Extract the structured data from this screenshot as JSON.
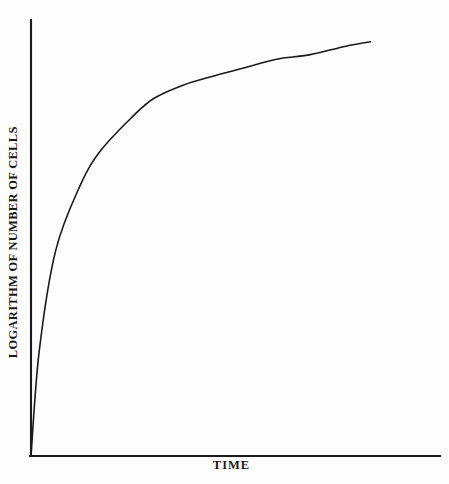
{
  "chart_data": {
    "type": "line",
    "title": "",
    "subtitle": "",
    "xlabel": "TIME",
    "ylabel": "LOGARITHM OF NUMBER OF CELLS",
    "x_tick_labels": [],
    "y_tick_labels": [],
    "grid": false,
    "legend": null,
    "legend_position": "none",
    "xlim": [
      0,
      1
    ],
    "ylim": [
      0,
      1
    ],
    "annotations": [],
    "series": [
      {
        "name": "growth curve",
        "description": "Bacterial growth: steep exponential rise followed by gradual flattening toward a stationary phase",
        "line_color": "#1a1a1a",
        "line_width": 1.6,
        "x": [
          0.0,
          0.02,
          0.06,
          0.12,
          0.17,
          0.25,
          0.3,
          0.37,
          0.44,
          0.52,
          0.6,
          0.68,
          0.77,
          0.83
        ],
        "y": [
          0.0,
          0.24,
          0.47,
          0.62,
          0.7,
          0.78,
          0.82,
          0.85,
          0.87,
          0.89,
          0.91,
          0.92,
          0.94,
          0.95
        ]
      }
    ]
  },
  "axes": {
    "y_axis_line": {
      "x": 31,
      "y_top": 20,
      "y_bottom": 456
    },
    "x_axis_line": {
      "y": 456,
      "x_left": 31,
      "x_right": 440
    },
    "axis_color": "#1a1a1a"
  },
  "colors": {
    "background": "#fdfdfd",
    "ink": "#1a1a1a"
  }
}
